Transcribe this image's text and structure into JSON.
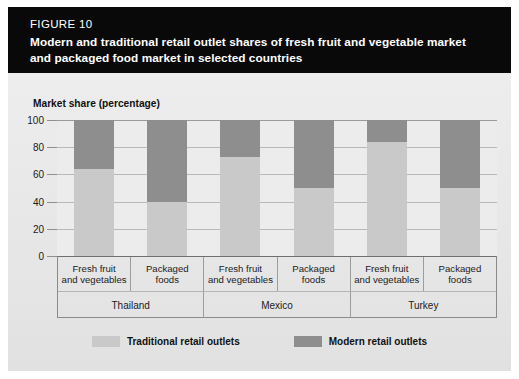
{
  "header": {
    "figure_number": "FIGURE 10",
    "title_line1": "Modern and traditional retail outlet shares of fresh fruit and vegetable market",
    "title_line2": "and packaged food market in selected countries",
    "background_color": "#090909",
    "text_color": "#ffffff"
  },
  "colors": {
    "traditional": "#c9c9c9",
    "modern": "#8e8e8e",
    "plate": "#e9e9e9",
    "plot_background": "#ececec",
    "gridline": "#9a9a9a",
    "axis_text": "#1b1b1b"
  },
  "axis": {
    "y_title": "Market share (percentage)",
    "y_ticks": [
      "100",
      "80",
      "60",
      "40",
      "20",
      "0"
    ],
    "y_min": 0,
    "y_max": 100
  },
  "legend": {
    "items": [
      {
        "label": "Traditional retail outlets",
        "color": "#c9c9c9",
        "swatch_name": "legend-swatch-traditional"
      },
      {
        "label": "Modern retail outlets",
        "color": "#8e8e8e",
        "swatch_name": "legend-swatch-modern"
      }
    ]
  },
  "chart_data": {
    "type": "bar",
    "subtype": "stacked-100-percent",
    "title": "Modern and traditional retail outlet shares of fresh fruit and vegetable market and packaged food market in selected countries",
    "xlabel": "",
    "ylabel": "Market share (percentage)",
    "ylim": [
      0,
      100
    ],
    "yticks": [
      0,
      20,
      40,
      60,
      80,
      100
    ],
    "grid": true,
    "legend_position": "bottom-center",
    "groups": [
      "Thailand",
      "Mexico",
      "Turkey"
    ],
    "categories": [
      "Fresh fruit and vegetables",
      "Packaged foods",
      "Fresh fruit and vegetables",
      "Packaged foods",
      "Fresh fruit and vegetables",
      "Packaged foods"
    ],
    "category_lines": [
      [
        "Fresh fruit",
        "and vegetables"
      ],
      [
        "Packaged",
        "foods"
      ],
      [
        "Fresh fruit",
        "and vegetables"
      ],
      [
        "Packaged",
        "foods"
      ],
      [
        "Fresh fruit",
        "and vegetables"
      ],
      [
        "Packaged",
        "foods"
      ]
    ],
    "series": [
      {
        "name": "Traditional retail outlets",
        "color": "#c9c9c9",
        "values": [
          64,
          40,
          73,
          50,
          84,
          50
        ]
      },
      {
        "name": "Modern retail outlets",
        "color": "#8e8e8e",
        "values": [
          36,
          60,
          27,
          50,
          16,
          50
        ]
      }
    ],
    "bars": [
      {
        "group": "Thailand",
        "category": "Fresh fruit and vegetables",
        "traditional": 64,
        "modern": 36
      },
      {
        "group": "Thailand",
        "category": "Packaged foods",
        "traditional": 40,
        "modern": 60
      },
      {
        "group": "Mexico",
        "category": "Fresh fruit and vegetables",
        "traditional": 73,
        "modern": 27
      },
      {
        "group": "Mexico",
        "category": "Packaged foods",
        "traditional": 50,
        "modern": 50
      },
      {
        "group": "Turkey",
        "category": "Fresh fruit and vegetables",
        "traditional": 84,
        "modern": 16
      },
      {
        "group": "Turkey",
        "category": "Packaged foods",
        "traditional": 50,
        "modern": 50
      }
    ]
  }
}
